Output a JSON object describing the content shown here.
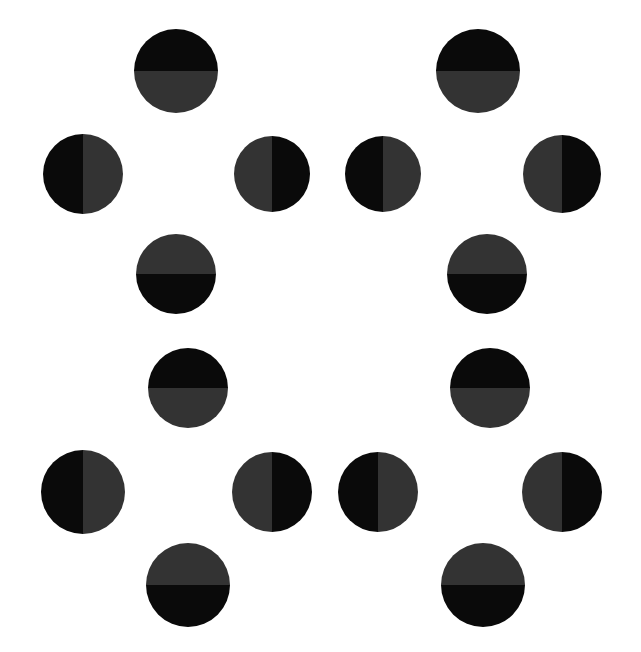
{
  "image": {
    "title": "Split-Circle Dot Pattern",
    "width": 641,
    "height": 652,
    "background_color": "#ffffff",
    "shape_count": 16
  },
  "palette": {
    "black": "#0a0a0a",
    "dark_gray": "#333333",
    "background": "#ffffff"
  },
  "legend": {
    "black_label": "black",
    "gray_label": "dark gray",
    "split_horizontal_label": "horizontal split",
    "split_vertical_label": "vertical split"
  },
  "chart_data": {
    "type": "scatter",
    "xlabel": "",
    "ylabel": "",
    "xlim": [
      0,
      641
    ],
    "ylim": [
      0,
      652
    ],
    "grid": false,
    "legend_position": "none",
    "marker": "circle",
    "series": [
      {
        "name": "split circles",
        "points": [
          {
            "id": "r1c1",
            "row": 1,
            "x": 176,
            "y": 71,
            "d": 84,
            "split": "h",
            "a": "#0a0a0a",
            "b": "#333333",
            "pattern": "top-black-bottom-gray"
          },
          {
            "id": "r1c2",
            "row": 1,
            "x": 478,
            "y": 71,
            "d": 84,
            "split": "h",
            "a": "#0a0a0a",
            "b": "#333333",
            "pattern": "top-black-bottom-gray"
          },
          {
            "id": "r2c1",
            "row": 2,
            "x": 83,
            "y": 174,
            "d": 80,
            "split": "v",
            "a": "#0a0a0a",
            "b": "#333333",
            "pattern": "left-black-right-gray"
          },
          {
            "id": "r2c2",
            "row": 2,
            "x": 272,
            "y": 174,
            "d": 76,
            "split": "v",
            "a": "#333333",
            "b": "#0a0a0a",
            "pattern": "left-gray-right-black"
          },
          {
            "id": "r2c3",
            "row": 2,
            "x": 383,
            "y": 174,
            "d": 76,
            "split": "v",
            "a": "#0a0a0a",
            "b": "#333333",
            "pattern": "left-black-right-gray"
          },
          {
            "id": "r2c4",
            "row": 2,
            "x": 562,
            "y": 174,
            "d": 78,
            "split": "v",
            "a": "#333333",
            "b": "#0a0a0a",
            "pattern": "left-gray-right-black"
          },
          {
            "id": "r3c1",
            "row": 3,
            "x": 176,
            "y": 274,
            "d": 80,
            "split": "h",
            "a": "#333333",
            "b": "#0a0a0a",
            "pattern": "top-gray-bottom-black"
          },
          {
            "id": "r3c2",
            "row": 3,
            "x": 487,
            "y": 274,
            "d": 80,
            "split": "h",
            "a": "#333333",
            "b": "#0a0a0a",
            "pattern": "top-gray-bottom-black"
          },
          {
            "id": "r4c1",
            "row": 4,
            "x": 188,
            "y": 388,
            "d": 80,
            "split": "h",
            "a": "#0a0a0a",
            "b": "#333333",
            "pattern": "top-black-bottom-gray"
          },
          {
            "id": "r4c2",
            "row": 4,
            "x": 490,
            "y": 388,
            "d": 80,
            "split": "h",
            "a": "#0a0a0a",
            "b": "#333333",
            "pattern": "top-black-bottom-gray"
          },
          {
            "id": "r5c1",
            "row": 5,
            "x": 83,
            "y": 492,
            "d": 84,
            "split": "v",
            "a": "#0a0a0a",
            "b": "#333333",
            "pattern": "left-black-right-gray"
          },
          {
            "id": "r5c2",
            "row": 5,
            "x": 272,
            "y": 492,
            "d": 80,
            "split": "v",
            "a": "#333333",
            "b": "#0a0a0a",
            "pattern": "left-gray-right-black"
          },
          {
            "id": "r5c3",
            "row": 5,
            "x": 378,
            "y": 492,
            "d": 80,
            "split": "v",
            "a": "#0a0a0a",
            "b": "#333333",
            "pattern": "left-black-right-gray"
          },
          {
            "id": "r5c4",
            "row": 5,
            "x": 562,
            "y": 492,
            "d": 80,
            "split": "v",
            "a": "#333333",
            "b": "#0a0a0a",
            "pattern": "left-gray-right-black"
          },
          {
            "id": "r6c1",
            "row": 6,
            "x": 188,
            "y": 585,
            "d": 84,
            "split": "h",
            "a": "#333333",
            "b": "#0a0a0a",
            "pattern": "top-gray-bottom-black"
          },
          {
            "id": "r6c2",
            "row": 6,
            "x": 483,
            "y": 585,
            "d": 84,
            "split": "h",
            "a": "#333333",
            "b": "#0a0a0a",
            "pattern": "top-gray-bottom-black"
          }
        ]
      }
    ]
  }
}
